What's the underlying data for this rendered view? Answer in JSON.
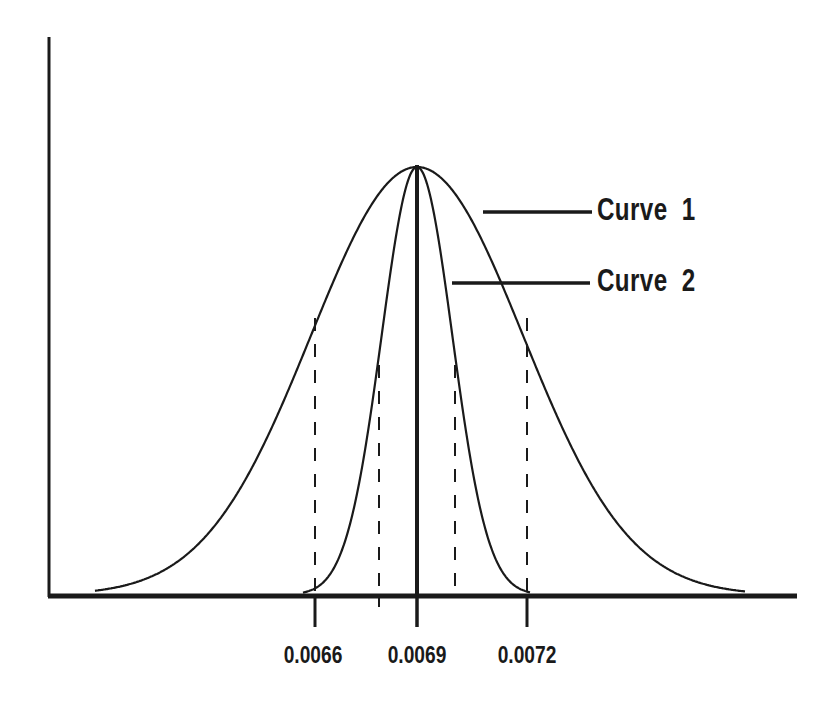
{
  "chart_data": {
    "type": "line",
    "title": "",
    "xlabel": "",
    "ylabel": "",
    "grid": false,
    "legend_position": "right, annotated with leader lines",
    "x_ticks": [
      0.0066,
      0.0069,
      0.0072
    ],
    "x_tick_labels": [
      "0.0066",
      "0.0069",
      "0.0072"
    ],
    "xlim": [
      0.00552,
      0.00759
    ],
    "ylim": [
      0,
      1.0
    ],
    "series": [
      {
        "name": "Curve 1",
        "kind": "normal distribution",
        "mean": 0.0069,
        "sigma": 0.0003,
        "peak": 1.0,
        "inflection_dashed_lines_x": [
          0.0066,
          0.0072
        ]
      },
      {
        "name": "Curve 2",
        "kind": "normal distribution",
        "mean": 0.0069,
        "sigma": 0.0001,
        "peak": 1.0,
        "inflection_dashed_lines_x": [
          0.0068,
          0.007
        ]
      }
    ],
    "annotations": [
      {
        "type": "vertical solid line",
        "x": 0.0069,
        "label": "mean"
      }
    ]
  },
  "legend": {
    "curve1": "Curve  1",
    "curve2": "Curve  2"
  },
  "ticks": {
    "t1": "0.0066",
    "t2": "0.0069",
    "t3": "0.0072"
  },
  "colors": {
    "ink": "#1a1a1a",
    "background": "#ffffff"
  }
}
